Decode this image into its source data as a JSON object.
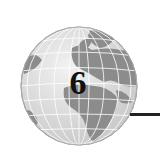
{
  "chapter": {
    "number": "6",
    "icon": "globe-icon"
  },
  "colors": {
    "land": "#8a8a8a",
    "ocean": "#e6e6e6",
    "grid": "#ffffff",
    "text": "#111111",
    "rule": "#222222"
  }
}
